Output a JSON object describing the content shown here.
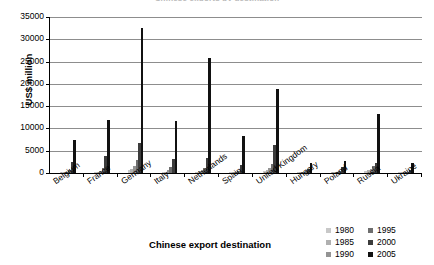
{
  "chart_data": {
    "type": "bar",
    "title": "Chinese exports by destination",
    "xlabel": "Chinese export destination",
    "ylabel": "US$ million",
    "ylim": [
      0,
      35000
    ],
    "ytick_step": 5000,
    "yticks": [
      "0",
      "5000",
      "10000",
      "15000",
      "20000",
      "25000",
      "30000",
      "35000"
    ],
    "grid": true,
    "legend_position": "bottom-right",
    "categories": [
      "Belgium",
      "France",
      "Germany",
      "Italy",
      "Netherlands",
      "Spain",
      "United Kingdom",
      "Hungary",
      "Poland",
      "Russia",
      "Ukraine"
    ],
    "series": [
      {
        "name": "1980",
        "color": "#c8c8c8",
        "values": [
          120,
          200,
          700,
          200,
          250,
          90,
          500,
          100,
          150,
          400,
          60
        ]
      },
      {
        "name": "1985",
        "color": "#b0b0b0",
        "values": [
          160,
          300,
          900,
          300,
          350,
          120,
          700,
          120,
          180,
          600,
          80
        ]
      },
      {
        "name": "1990",
        "color": "#949494",
        "values": [
          300,
          500,
          1500,
          600,
          600,
          250,
          1100,
          200,
          250,
          900,
          120
        ]
      },
      {
        "name": "1995",
        "color": "#6e6e6e",
        "values": [
          700,
          1100,
          3000,
          1400,
          1200,
          500,
          2000,
          350,
          500,
          1500,
          250
        ]
      },
      {
        "name": "2000",
        "color": "#3c3c3c",
        "values": [
          2500,
          3900,
          6800,
          3100,
          3300,
          1800,
          6300,
          800,
          1300,
          2300,
          600
        ]
      },
      {
        "name": "2005",
        "color": "#111111",
        "values": [
          7500,
          11800,
          32500,
          11700,
          25900,
          8200,
          18900,
          2200,
          2600,
          13200,
          2200
        ]
      }
    ]
  }
}
